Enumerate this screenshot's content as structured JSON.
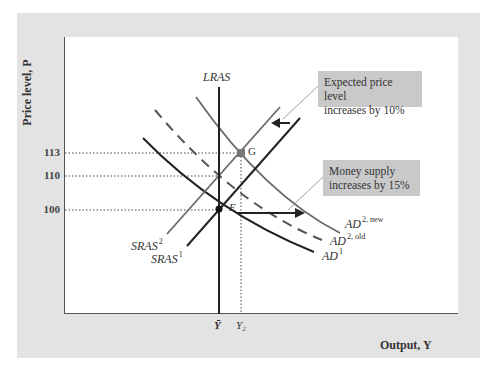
{
  "axes": {
    "y_label": "Price level, P",
    "x_label": "Output, Y",
    "y_ticks": [
      {
        "label": "113",
        "y": 153
      },
      {
        "label": "110",
        "y": 176
      },
      {
        "label": "100",
        "y": 210
      }
    ],
    "x_ticks": [
      {
        "label": "Ȳ",
        "x": 219
      },
      {
        "label": "Y₂",
        "x": 241
      }
    ]
  },
  "curves": {
    "lras": {
      "label": "LRAS"
    },
    "sras1": {
      "label": "SRAS",
      "sup": "1"
    },
    "sras2": {
      "label": "SRAS",
      "sup": "2"
    },
    "ad1": {
      "label": "AD",
      "sup": "1"
    },
    "ad2_old": {
      "label": "AD",
      "sup": "2, old"
    },
    "ad2_new": {
      "label": "AD",
      "sup": "2, new"
    }
  },
  "points": {
    "E": {
      "label": "E",
      "price": 100,
      "output": "Ȳ"
    },
    "G": {
      "label": "G",
      "price": 113,
      "output": "Y₂"
    }
  },
  "callouts": {
    "expected_price": {
      "line1": "Expected price level",
      "line2": "increases by 10%"
    },
    "money_supply": {
      "line1": "Money supply",
      "line2": "increases by 15%"
    }
  },
  "colors": {
    "panel_bg": "#e3e3e3",
    "plot_bg": "#ffffff",
    "callout_bg": "#c9c9c9",
    "dark_curve": "#222222",
    "gray_curve": "#666666",
    "dashed_curve": "#555555"
  }
}
